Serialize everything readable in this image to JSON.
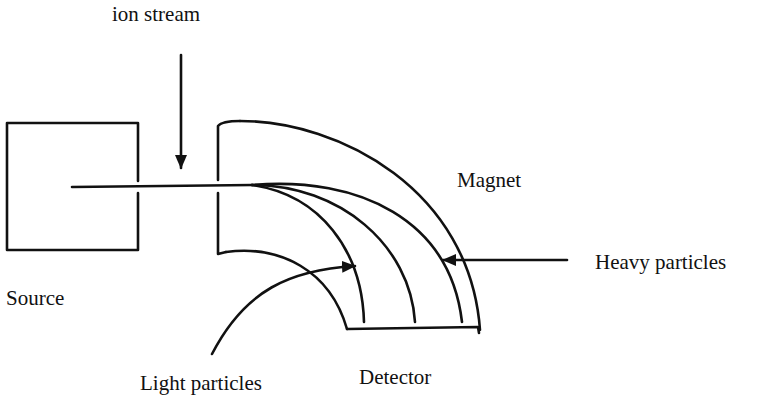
{
  "diagram": {
    "labels": {
      "ion_stream": "ion stream",
      "magnet": "Magnet",
      "heavy_particles": "Heavy particles",
      "source": "Source",
      "light_particles": "Light particles",
      "detector": "Detector"
    },
    "components": [
      "Source",
      "Magnet",
      "Detector"
    ],
    "trajectories": [
      "light",
      "medium",
      "heavy"
    ],
    "colors": {
      "stroke": "#111111",
      "background": "#ffffff"
    }
  }
}
